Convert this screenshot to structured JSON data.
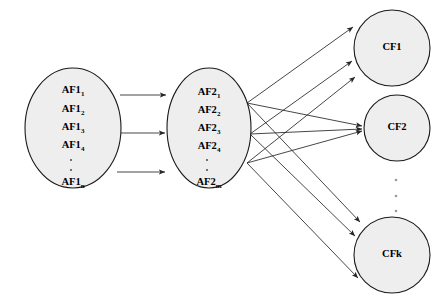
{
  "figure": {
    "type": "diagram",
    "subtype": "layered-network-graph",
    "background_color": "#ffffff",
    "node_fill": "#eeeeee",
    "node_stroke": "#1a1a1a",
    "edge_color": "#262626",
    "caption_fragment": ""
  },
  "layers": [
    {
      "id": "layer-af1",
      "name": "AF1 layer",
      "shape": "ellipse",
      "cx": 73,
      "cy": 128,
      "rx": 48,
      "ry": 60,
      "labels": [
        {
          "base": "AF1",
          "sub": "1"
        },
        {
          "base": "AF1",
          "sub": "2"
        },
        {
          "base": "AF1",
          "sub": "3"
        },
        {
          "base": "AF1",
          "sub": "4"
        },
        {
          "base": "AF1",
          "sub": "n"
        }
      ],
      "ellipsis_after_index": 3,
      "ellipsis_dots": 2
    },
    {
      "id": "layer-af2",
      "name": "AF2 layer",
      "shape": "ellipse",
      "cx": 209,
      "cy": 128,
      "rx": 42,
      "ry": 60,
      "labels": [
        {
          "base": "AF2",
          "sub": "1"
        },
        {
          "base": "AF2",
          "sub": "2"
        },
        {
          "base": "AF2",
          "sub": "3"
        },
        {
          "base": "AF2",
          "sub": "4"
        },
        {
          "base": "AF2",
          "sub": "m"
        }
      ],
      "ellipsis_after_index": 3,
      "ellipsis_dots": 2
    }
  ],
  "output_nodes": [
    {
      "id": "cf1",
      "label": "CF1",
      "cx": 392,
      "cy": 48,
      "r": 38
    },
    {
      "id": "cf2",
      "label": "CF2",
      "cx": 397,
      "cy": 128,
      "r": 33
    },
    {
      "id": "cfk",
      "label": "CFk",
      "cx": 392,
      "cy": 255,
      "r": 38
    }
  ],
  "output_ellipsis": {
    "cx": 396,
    "dots": 3,
    "y_positions": [
      180,
      196,
      211
    ]
  },
  "inter_layer_edges": {
    "name": "AF1 to AF2 parallel arrows",
    "count": 3,
    "pairs": [
      {
        "x1": 120,
        "y1": 95,
        "x2": 168,
        "y2": 95
      },
      {
        "x1": 121,
        "y1": 133,
        "x2": 167,
        "y2": 133
      },
      {
        "x1": 117,
        "y1": 172,
        "x2": 167,
        "y2": 172
      }
    ]
  },
  "fanout_edges": {
    "name": "AF2 to CF full bipartite arrows",
    "count": 9,
    "source_points": [
      {
        "x": 247,
        "y": 103
      },
      {
        "x": 250,
        "y": 134
      },
      {
        "x": 247,
        "y": 163
      }
    ],
    "target_points": [
      {
        "x": 355,
        "y": 27
      },
      {
        "x": 354,
        "y": 62
      },
      {
        "x": 357,
        "y": 78
      },
      {
        "x": 364,
        "y": 128
      },
      {
        "x": 362,
        "y": 224
      },
      {
        "x": 357,
        "y": 238
      },
      {
        "x": 360,
        "y": 280
      }
    ]
  }
}
